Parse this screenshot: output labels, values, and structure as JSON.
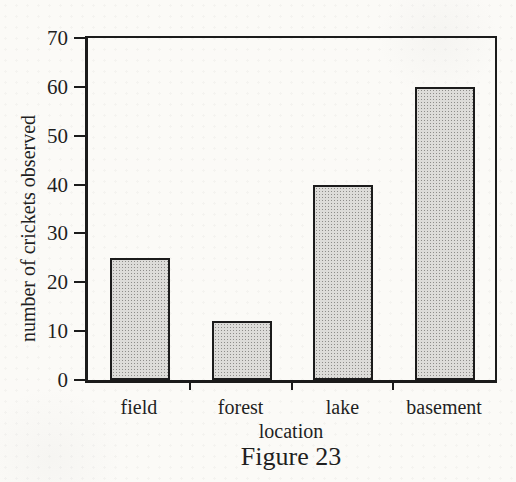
{
  "figure": {
    "caption": "Figure 23"
  },
  "chart_data": {
    "type": "bar",
    "categories": [
      "field",
      "forest",
      "lake",
      "basement"
    ],
    "values": [
      25,
      12,
      40,
      60
    ],
    "title": "",
    "xlabel": "location",
    "ylabel": "number of crickets observed",
    "ylim": [
      0,
      70
    ],
    "yticks": [
      0,
      10,
      20,
      30,
      40,
      50,
      60,
      70
    ],
    "grid": false,
    "legend": false,
    "bar_fill_color": "#cbcac7",
    "bar_border_color": "#1b1b1b",
    "axis_color": "#1b1b1b",
    "text_color": "#1f1f1f",
    "background_color": "#fbfaf7"
  }
}
